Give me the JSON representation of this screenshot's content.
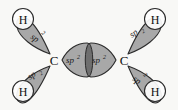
{
  "figure": {
    "background_color": "#f8f8f6",
    "lobe_fill_color": "#a8a8a8",
    "lobe_overlap_color": "#6e6e6e",
    "outline_color": "#2b2b2b",
    "text_color": "#111111",
    "circle_fill_color": "#fdfdfd"
  },
  "atoms": {
    "carbon_left": {
      "symbol": "C",
      "x": 54,
      "y": 60
    },
    "carbon_right": {
      "symbol": "C",
      "x": 124,
      "y": 60
    },
    "hydrogen_top_left": {
      "symbol": "H",
      "x": 23,
      "y": 19
    },
    "hydrogen_bottom_left": {
      "symbol": "H",
      "x": 23,
      "y": 91
    },
    "hydrogen_top_right": {
      "symbol": "H",
      "x": 155,
      "y": 19
    },
    "hydrogen_bottom_right": {
      "symbol": "H",
      "x": 155,
      "y": 91
    }
  },
  "orbitals": {
    "label_base": "sp",
    "label_superscript": "2",
    "label_full": "sp2",
    "list": [
      {
        "name": "sp2-orbital-top-left",
        "label_base": "sp",
        "label_superscript": "2",
        "bond_to": "H",
        "label_x": 36,
        "label_y": 35
      },
      {
        "name": "sp2-orbital-bottom-left",
        "label_base": "sp",
        "label_superscript": "2",
        "bond_to": "H",
        "label_x": 36,
        "label_y": 80
      },
      {
        "name": "sp2-orbital-center-left",
        "label_base": "sp",
        "label_superscript": "2",
        "bond_to": "C",
        "label_x": 72,
        "label_y": 60
      },
      {
        "name": "sp2-orbital-center-right",
        "label_base": "sp",
        "label_superscript": "2",
        "bond_to": "C",
        "label_x": 97,
        "label_y": 60
      },
      {
        "name": "sp2-orbital-top-right",
        "label_base": "sp",
        "label_superscript": "2",
        "bond_to": "H",
        "label_x": 138,
        "label_y": 35
      },
      {
        "name": "sp2-orbital-bottom-right",
        "label_base": "sp",
        "label_superscript": "2",
        "bond_to": "H",
        "label_x": 138,
        "label_y": 80
      }
    ]
  }
}
